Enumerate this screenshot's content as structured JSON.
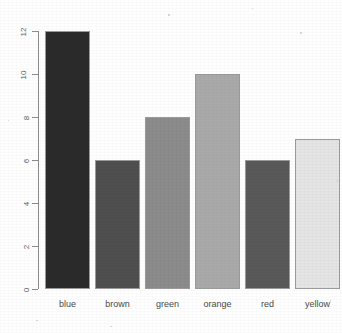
{
  "chart_data": {
    "type": "bar",
    "title": "",
    "subtitle": "",
    "xlabel": "",
    "ylabel": "",
    "categories": [
      "blue",
      "brown",
      "green",
      "orange",
      "red",
      "yellow"
    ],
    "values": [
      12,
      6,
      8,
      10,
      6,
      7
    ],
    "bar_colors": [
      "#2b2b2b",
      "#4f4f4f",
      "#8b8b8b",
      "#a9a9a9",
      "#595959",
      "#e4e4e4"
    ],
    "bar_border_color": "#9a9a9a",
    "ylim": [
      0,
      12
    ],
    "ytick_values": [
      0,
      2,
      4,
      6,
      8,
      10,
      12
    ],
    "ytick_labels": [
      "0",
      "2",
      "4",
      "6",
      "8",
      "10",
      "12"
    ],
    "ytick_label_rotation": -90,
    "xtick_labels": [
      "blue",
      "brown",
      "green",
      "orange",
      "red",
      "yellow"
    ],
    "grid": false,
    "legend": null,
    "axis_color": "#8c8c8c",
    "background": "#ffffff",
    "series": [
      {
        "name": "count",
        "values": [
          12,
          6,
          8,
          10,
          6,
          7
        ]
      }
    ],
    "points": [
      {
        "category": "blue",
        "value": 12,
        "color": "#2b2b2b"
      },
      {
        "category": "brown",
        "value": 6,
        "color": "#4f4f4f"
      },
      {
        "category": "green",
        "value": 8,
        "color": "#8b8b8b"
      },
      {
        "category": "orange",
        "value": 10,
        "color": "#a9a9a9"
      },
      {
        "category": "red",
        "value": 6,
        "color": "#595959"
      },
      {
        "category": "yellow",
        "value": 7,
        "color": "#e4e4e4"
      }
    ]
  }
}
